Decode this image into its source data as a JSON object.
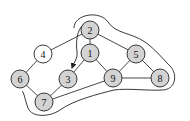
{
  "diagram": {
    "type": "graph",
    "colors": {
      "highlighted_fill": "#d3d3d3",
      "plain_fill": "#ffffff",
      "stroke": "#222222"
    },
    "nodes": [
      {
        "id": "1",
        "label": "1",
        "x": 90,
        "y": 53,
        "highlighted": true
      },
      {
        "id": "2",
        "label": "2",
        "x": 90,
        "y": 30,
        "highlighted": true
      },
      {
        "id": "3",
        "label": "3",
        "x": 68,
        "y": 79,
        "highlighted": true
      },
      {
        "id": "4",
        "label": "4",
        "x": 43,
        "y": 54,
        "highlighted": false
      },
      {
        "id": "5",
        "label": "5",
        "x": 136,
        "y": 54,
        "highlighted": true
      },
      {
        "id": "6",
        "label": "6",
        "x": 20,
        "y": 79,
        "highlighted": true
      },
      {
        "id": "7",
        "label": "7",
        "x": 44,
        "y": 102,
        "highlighted": true
      },
      {
        "id": "8",
        "label": "8",
        "x": 160,
        "y": 78,
        "highlighted": true
      },
      {
        "id": "9",
        "label": "9",
        "x": 113,
        "y": 78,
        "highlighted": true
      }
    ],
    "edges": [
      {
        "from": "2",
        "to": "1"
      },
      {
        "from": "2",
        "to": "4"
      },
      {
        "from": "2",
        "to": "5"
      },
      {
        "from": "1",
        "to": "3"
      },
      {
        "from": "1",
        "to": "9"
      },
      {
        "from": "4",
        "to": "6"
      },
      {
        "from": "6",
        "to": "7"
      },
      {
        "from": "3",
        "to": "7"
      },
      {
        "from": "7",
        "to": "9"
      },
      {
        "from": "5",
        "to": "9"
      },
      {
        "from": "5",
        "to": "8"
      },
      {
        "from": "9",
        "to": "8"
      }
    ],
    "directed_arrow": {
      "from": "2",
      "to": "3",
      "description": "curved arrow from node 2 to node 3"
    },
    "enclosing_region": {
      "description": "closed outline enclosing nodes 2, 5, 8, 9, 7 and passing near 6"
    }
  }
}
